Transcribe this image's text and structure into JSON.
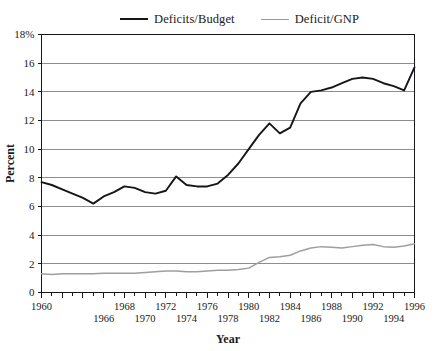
{
  "legend": {
    "position": "top-center",
    "entries": [
      {
        "label": "Deficits/Budget",
        "color": "#16161a",
        "swatch": "line-swatch-black"
      },
      {
        "label": "Deficit/GNP",
        "color": "#9e9e9e",
        "swatch": "line-swatch-grey"
      }
    ]
  },
  "axes": {
    "xlabel": "Year",
    "ylabel": "Percent",
    "ytop_label": "18%"
  },
  "chart_data": {
    "type": "line",
    "title": "",
    "subtitle": "",
    "xlabel": "Year",
    "ylabel": "Percent",
    "xlim": [
      1960,
      1996
    ],
    "ylim": [
      0,
      18
    ],
    "ytick_values": [
      0,
      2,
      4,
      6,
      8,
      10,
      12,
      14,
      16,
      18
    ],
    "ytick_labels": [
      "0",
      "2",
      "4",
      "6",
      "8",
      "10",
      "12",
      "14",
      "16",
      "18%"
    ],
    "xtick_values": [
      1960,
      1962,
      1964,
      1966,
      1968,
      1970,
      1972,
      1974,
      1976,
      1978,
      1980,
      1982,
      1984,
      1986,
      1988,
      1990,
      1992,
      1994,
      1996
    ],
    "xtick_labels_upper": [
      "1960",
      "1968",
      "1972",
      "1976",
      "1980",
      "1984",
      "1988",
      "1992",
      "1996"
    ],
    "xtick_labels_upper_values": [
      1960,
      1968,
      1972,
      1976,
      1980,
      1984,
      1988,
      1992,
      1996
    ],
    "xtick_labels_lower": [
      "1966",
      "1970",
      "1974",
      "1978",
      "1982",
      "1986",
      "1990",
      "1994"
    ],
    "xtick_labels_lower_values": [
      1966,
      1970,
      1974,
      1978,
      1982,
      1986,
      1990,
      1994
    ],
    "grid": "horizontal",
    "legend_position": "top",
    "x": [
      1960,
      1961,
      1962,
      1963,
      1964,
      1965,
      1966,
      1967,
      1968,
      1969,
      1970,
      1971,
      1972,
      1973,
      1974,
      1975,
      1976,
      1977,
      1978,
      1979,
      1980,
      1981,
      1982,
      1983,
      1984,
      1985,
      1986,
      1987,
      1988,
      1989,
      1990,
      1991,
      1992,
      1993,
      1994,
      1995,
      1996
    ],
    "series": [
      {
        "name": "Deficits/Budget",
        "color": "#16161a",
        "values": [
          7.7,
          7.5,
          7.2,
          6.9,
          6.6,
          6.2,
          6.7,
          7.0,
          7.4,
          7.3,
          7.0,
          6.9,
          7.1,
          8.1,
          7.5,
          7.4,
          7.4,
          7.6,
          8.2,
          9.0,
          10.0,
          11.0,
          11.8,
          11.1,
          11.5,
          13.2,
          14.0,
          14.1,
          14.3,
          14.6,
          14.9,
          15.0,
          14.9,
          14.6,
          14.4,
          14.1,
          15.7
        ]
      },
      {
        "name": "Deficit/GNP",
        "color": "#9e9e9e",
        "values": [
          1.3,
          1.25,
          1.3,
          1.3,
          1.3,
          1.3,
          1.35,
          1.35,
          1.35,
          1.35,
          1.4,
          1.45,
          1.5,
          1.5,
          1.45,
          1.45,
          1.5,
          1.55,
          1.55,
          1.6,
          1.7,
          2.1,
          2.45,
          2.5,
          2.6,
          2.9,
          3.1,
          3.2,
          3.15,
          3.1,
          3.2,
          3.3,
          3.35,
          3.2,
          3.15,
          3.25,
          3.4
        ]
      }
    ]
  }
}
